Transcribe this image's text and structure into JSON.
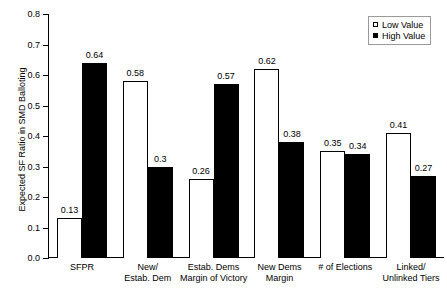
{
  "chart_data": {
    "type": "bar",
    "title": "",
    "subtitle": "",
    "xlabel": "",
    "ylabel": "Expected SF Ratio in SMD Balloting",
    "ylim": [
      0.0,
      0.8
    ],
    "ytick_labels": [
      "0.0",
      "0.1",
      "0.2",
      "0.3",
      "0.4",
      "0.5",
      "0.6",
      "0.7",
      "0.8"
    ],
    "ytick_values": [
      0.0,
      0.1,
      0.2,
      0.3,
      0.4,
      0.5,
      0.6,
      0.7,
      0.8
    ],
    "grid": false,
    "legend_position": "top-right",
    "categories": [
      "SFPR",
      "New/\nEstab. Dem",
      "Estab. Dems\nMargin of Victory",
      "New Dems\nMargin",
      "# of Elections",
      "Linked/\nUnlinked Tiers"
    ],
    "category_lines": [
      [
        "SFPR"
      ],
      [
        "New/",
        "Estab. Dem"
      ],
      [
        "Estab. Dems",
        "Margin of Victory"
      ],
      [
        "New Dems",
        "Margin"
      ],
      [
        "# of Elections"
      ],
      [
        "Linked/",
        "Unlinked Tiers"
      ]
    ],
    "series": [
      {
        "name": "Low Value",
        "color": "#ffffff",
        "values": [
          0.13,
          0.58,
          0.26,
          0.62,
          0.35,
          0.41
        ],
        "labels": [
          "0.13",
          "0.58",
          "0.26",
          "0.62",
          "0.35",
          "0.41"
        ]
      },
      {
        "name": "High Value",
        "color": "#000000",
        "values": [
          0.64,
          0.3,
          0.57,
          0.38,
          0.34,
          0.27
        ],
        "labels": [
          "0.64",
          "0.3",
          "0.57",
          "0.38",
          "0.34",
          "0.27"
        ]
      }
    ]
  },
  "legend": {
    "items": [
      {
        "label": "Low Value",
        "swatch": "open-square"
      },
      {
        "label": "High Value",
        "swatch": "filled-square"
      }
    ]
  }
}
